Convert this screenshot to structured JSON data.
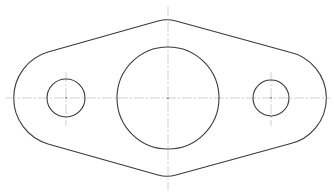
{
  "drawing": {
    "type": "engineering-part-drawing",
    "part": "flange-plate-with-three-holes",
    "line_color": "#3a3a3a",
    "center_line_color": "#b4b4b4",
    "background": "#ffffff",
    "center_line_y": 98,
    "outline": {
      "top_peak": [
        167,
        20
      ],
      "bottom_peak": [
        167,
        177
      ],
      "left_extreme_x": 18,
      "right_extreme_x": 318
    },
    "holes": [
      {
        "name": "left-hole",
        "cx": 66,
        "cy": 98,
        "r": 19
      },
      {
        "name": "center-bore",
        "cx": 168,
        "cy": 98,
        "r": 51
      },
      {
        "name": "right-hole",
        "cx": 271,
        "cy": 98,
        "r": 18
      }
    ],
    "labels": {
      "left_hole_note": "",
      "right_hole_note": "",
      "center_note": ""
    }
  }
}
